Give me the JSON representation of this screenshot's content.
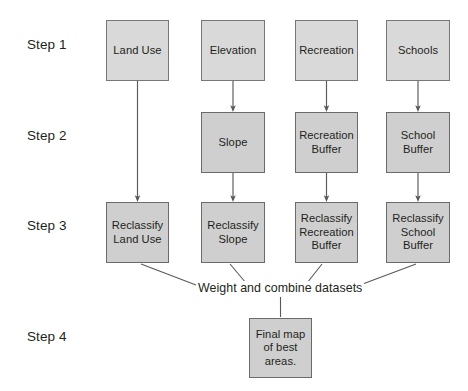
{
  "diagram": {
    "background_color": "#ffffff",
    "box_fill_color": "#d4d4d4",
    "box_border_color": "#6f6f6f",
    "line_color": "#58595b",
    "text_color": "#231f20"
  },
  "steps": [
    {
      "label": "Step 1"
    },
    {
      "label": "Step 2"
    },
    {
      "label": "Step 3"
    },
    {
      "label": "Step 4"
    }
  ],
  "row1": [
    {
      "label": "Land Use"
    },
    {
      "label": "Elevation"
    },
    {
      "label": "Recreation"
    },
    {
      "label": "Schools"
    }
  ],
  "row2": [
    {
      "label": "Slope"
    },
    {
      "label": "Recreation\nBuffer"
    },
    {
      "label": "School\nBuffer"
    }
  ],
  "row3": [
    {
      "label": "Reclassify\nLand Use"
    },
    {
      "label": "Reclassify\nSlope"
    },
    {
      "label": "Reclassify\nRecreation\nBuffer"
    },
    {
      "label": "Reclassify\nSchool\nBuffer"
    }
  ],
  "combine": {
    "label": "Weight and combine datasets"
  },
  "row4": [
    {
      "label": "Final map\nof best\nareas."
    }
  ]
}
